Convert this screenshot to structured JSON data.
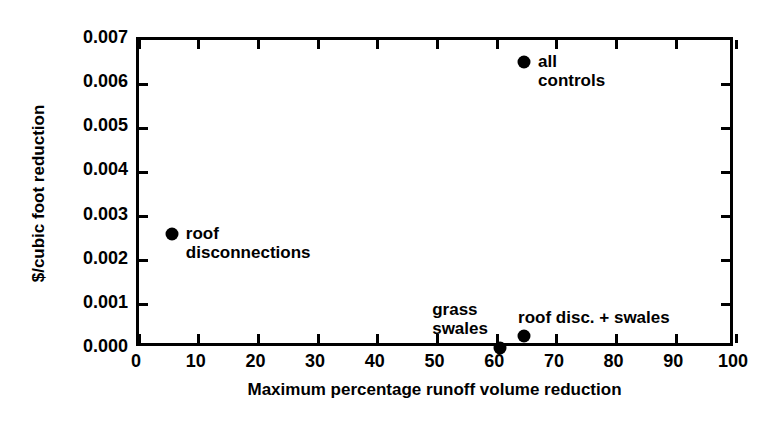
{
  "chart_data": {
    "type": "scatter",
    "title": "",
    "xlabel": "Maximum percentage runoff volume reduction",
    "ylabel": "$/cubic foot reduction",
    "xlim": [
      0,
      100
    ],
    "ylim": [
      0.0,
      0.007
    ],
    "grid": false,
    "legend": "none",
    "xticks": [
      0,
      10,
      20,
      30,
      40,
      50,
      60,
      70,
      80,
      90,
      100
    ],
    "xticklabels": [
      "0",
      "10",
      "20",
      "30",
      "40",
      "50",
      "60",
      "70",
      "80",
      "90",
      "100"
    ],
    "yticks": [
      0.0,
      0.001,
      0.002,
      0.003,
      0.004,
      0.005,
      0.006,
      0.007
    ],
    "yticklabels": [
      "0.000",
      "0.001",
      "0.002",
      "0.003",
      "0.004",
      "0.005",
      "0.006",
      "0.007"
    ],
    "points": [
      {
        "name": "roof disconnections",
        "label_lines": [
          "roof",
          "disconnections"
        ],
        "x": 5.5,
        "y": 0.0026,
        "label_position": "right"
      },
      {
        "name": "all controls",
        "label_lines": [
          "all",
          "controls"
        ],
        "x": 64.5,
        "y": 0.0065,
        "label_position": "right"
      },
      {
        "name": "grass swales",
        "label_lines": [
          "grass",
          "swales"
        ],
        "x": 60.5,
        "y": 2e-05,
        "label_position": "above-left"
      },
      {
        "name": "roof disc. + swales",
        "label_lines": [
          "roof disc. + swales"
        ],
        "x": 64.5,
        "y": 0.0003,
        "label_position": "above"
      }
    ],
    "marker_color": "#000000",
    "axis_color": "#000000",
    "background_color": "#ffffff"
  }
}
